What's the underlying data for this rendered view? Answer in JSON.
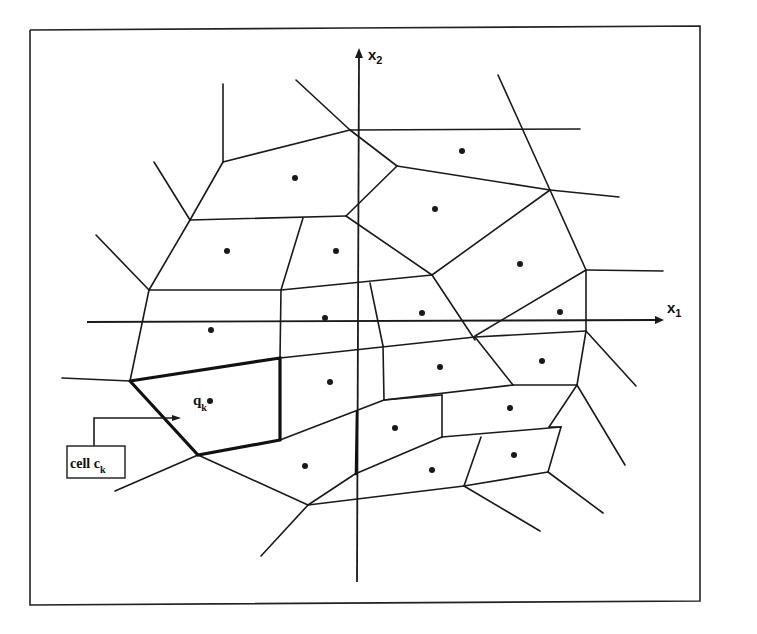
{
  "diagram": {
    "type": "voronoi-partition",
    "axes": {
      "x_label": "x",
      "x_sub": "1",
      "y_label": "x",
      "y_sub": "2"
    },
    "highlight": {
      "site_label": "q",
      "site_sub": "k",
      "cell_label": "cell c",
      "cell_sub": "k"
    },
    "colors": {
      "line": "#1a1a1a",
      "background": "#ffffff"
    }
  }
}
